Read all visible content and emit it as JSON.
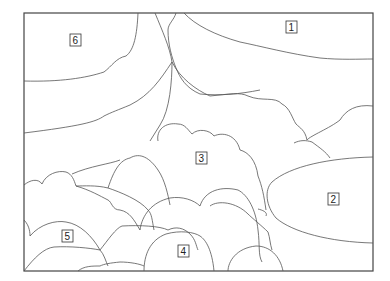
{
  "diagram": {
    "type": "line-art segmentation diagram",
    "labels": [
      {
        "id": "1",
        "text": "1"
      },
      {
        "id": "2",
        "text": "2"
      },
      {
        "id": "3",
        "text": "3"
      },
      {
        "id": "4",
        "text": "4"
      },
      {
        "id": "5",
        "text": "5"
      },
      {
        "id": "6",
        "text": "6"
      }
    ]
  }
}
